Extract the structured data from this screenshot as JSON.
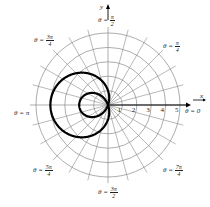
{
  "chart_data": {
    "type": "polar-line",
    "title": "",
    "equation": "r = 1 - 3cos(theta)",
    "curve_shape": "limacon with inner loop",
    "xlabel": "x",
    "ylabel": "y",
    "r_ticks": [
      "1",
      "2",
      "3",
      "4",
      "5"
    ],
    "r_range": [
      0,
      5
    ],
    "grid": {
      "circles": [
        1,
        2,
        3,
        4,
        5
      ],
      "radial_step_deg": 15
    },
    "angle_labels": [
      {
        "id": "a0",
        "pre": "θ = ",
        "text": "0"
      },
      {
        "id": "a1",
        "pre": "θ = ",
        "num": "π",
        "den": "4"
      },
      {
        "id": "a2",
        "pre": "θ = ",
        "num": "π",
        "den": "2"
      },
      {
        "id": "a3",
        "pre": "θ = ",
        "num": "3π",
        "den": "4"
      },
      {
        "id": "a4",
        "pre": "θ = ",
        "text": "π"
      },
      {
        "id": "a5",
        "pre": "θ = ",
        "num": "5π",
        "den": "4"
      },
      {
        "id": "a6",
        "pre": "θ = ",
        "num": "3π",
        "den": "2"
      },
      {
        "id": "a7",
        "pre": "θ = ",
        "num": "7π",
        "den": "4"
      }
    ],
    "key_points": [
      {
        "theta": "0",
        "r": -2
      },
      {
        "theta": "π/2",
        "r": 1
      },
      {
        "theta": "π",
        "r": 4
      },
      {
        "theta": "3π/2",
        "r": 1
      }
    ]
  },
  "axes": {
    "x_label": "x",
    "y_label": "y"
  },
  "colors": {
    "grid": "#8a8a8a",
    "curve": "#000000",
    "axis": "#000000",
    "text": "#222222"
  }
}
